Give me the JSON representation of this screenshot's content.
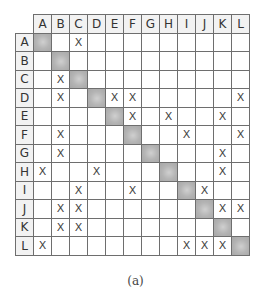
{
  "diagram": {
    "type": "design-structure-matrix",
    "labels": [
      "A",
      "B",
      "C",
      "D",
      "E",
      "F",
      "G",
      "H",
      "I",
      "J",
      "K",
      "L"
    ],
    "mark": "X",
    "diagonal_color": "#b4b4b4",
    "rows": {
      "A": [
        "C"
      ],
      "B": [],
      "C": [
        "B"
      ],
      "D": [
        "B",
        "E",
        "F",
        "L"
      ],
      "E": [
        "F",
        "H",
        "K"
      ],
      "F": [
        "B",
        "I",
        "L"
      ],
      "G": [
        "B",
        "K"
      ],
      "H": [
        "A",
        "D",
        "K"
      ],
      "I": [
        "C",
        "F",
        "J"
      ],
      "J": [
        "B",
        "C",
        "K",
        "L"
      ],
      "K": [
        "B",
        "C"
      ],
      "L": [
        "A",
        "I",
        "J",
        "K"
      ]
    }
  },
  "caption": "(a)"
}
